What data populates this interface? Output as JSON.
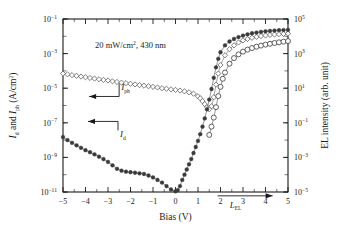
{
  "figure": {
    "annotation": "20 mW/cm2, 430 nm",
    "annotation_parts": {
      "pre": "20 mW/cm",
      "sup": "2",
      "post": ", 430 nm"
    },
    "background_color": "#ffffff",
    "foreground_color": "#1a1a1a"
  },
  "chart_data": {
    "type": "scatter",
    "title": "",
    "xlabel": "Bias (V)",
    "ylabel": "Id and Iph (A/cm2)",
    "y2label": "EL intensity (arb. unit)",
    "xlim": [
      -5,
      5
    ],
    "ylim": [
      1e-11,
      0.1
    ],
    "y2lim": [
      1e-05,
      100000.0
    ],
    "xscale": "linear",
    "yscale": "log",
    "y2scale": "log",
    "grid": false,
    "legend": "none",
    "xticks": [
      -5,
      -4,
      -3,
      -2,
      -1,
      0,
      1,
      2,
      3,
      4,
      5
    ],
    "xtick_labels": [
      "-5",
      "-4",
      "-3",
      "-2",
      "-1",
      "0",
      "1",
      "2",
      "3",
      "4",
      "5"
    ],
    "yticks": [
      1e-11,
      1e-09,
      1e-07,
      1e-05,
      0.001,
      0.1
    ],
    "ytick_labels": [
      "10-11",
      "10-9",
      "10-7",
      "10-5",
      "10-3",
      "10-1"
    ],
    "ytick_exponents": [
      -11,
      -9,
      -7,
      -5,
      -3,
      -1
    ],
    "y2ticks": [
      1e-05,
      0.001,
      0.1,
      10.0,
      1000.0,
      100000.0
    ],
    "y2tick_labels": [
      "10-5",
      "10-3",
      "10-1",
      "101",
      "103",
      "105"
    ],
    "y2tick_exponents": [
      -5,
      -3,
      -1,
      1,
      3,
      5
    ],
    "annotations": [
      {
        "text": "20 mW/cm2, 430 nm",
        "x": -2.0,
        "y": 0.002
      },
      {
        "text": "Iph",
        "x": -2.55,
        "y": 1.1e-05,
        "arrow_to_axis": "left"
      },
      {
        "text": "Id",
        "x": -2.6,
        "y": 1.2e-07,
        "arrow_to_axis": "left"
      },
      {
        "text": "LEL",
        "x": 2.85,
        "y": 6e-06,
        "arrow_to_axis": "right"
      }
    ],
    "series": [
      {
        "name": "Iph",
        "label": "Iph",
        "marker": "open-diamond",
        "color": "#555555",
        "axis": "left",
        "x": [
          -5.0,
          -4.8,
          -4.6,
          -4.4,
          -4.2,
          -4.0,
          -3.8,
          -3.6,
          -3.4,
          -3.2,
          -3.0,
          -2.8,
          -2.6,
          -2.4,
          -2.2,
          -2.0,
          -1.8,
          -1.6,
          -1.4,
          -1.2,
          -1.0,
          -0.8,
          -0.6,
          -0.4,
          -0.2,
          0.0,
          0.2,
          0.4,
          0.6,
          0.8,
          1.0,
          1.1,
          1.2,
          1.3,
          1.4,
          1.5,
          1.6,
          1.7,
          1.8,
          1.9,
          2.0,
          2.2,
          2.4,
          2.6,
          2.8,
          3.0,
          3.2,
          3.4,
          3.6,
          3.8,
          4.0,
          4.2,
          4.4,
          4.6,
          4.8,
          5.0
        ],
        "y": [
          7e-05,
          6.3e-05,
          5.7e-05,
          5.2e-05,
          4.7e-05,
          4.3e-05,
          3.9e-05,
          3.6e-05,
          3.3e-05,
          3e-05,
          2.8e-05,
          2.5e-05,
          2.3e-05,
          2.1e-05,
          1.95e-05,
          1.8e-05,
          1.65e-05,
          1.5e-05,
          1.4e-05,
          1.3e-05,
          1.2e-05,
          1.1e-05,
          1e-05,
          9.3e-06,
          8.6e-06,
          8e-06,
          7.3e-06,
          6.6e-06,
          5.8e-06,
          4.8e-06,
          3.4e-06,
          2.6e-06,
          1.8e-06,
          1.2e-06,
          8e-07,
          6e-07,
          9e-07,
          3e-06,
          1.6e-05,
          7e-05,
          0.00022,
          0.0008,
          0.0018,
          0.003,
          0.0044,
          0.0058,
          0.007,
          0.0082,
          0.0093,
          0.0103,
          0.0112,
          0.012,
          0.0127,
          0.0133,
          0.0138,
          0.0142
        ]
      },
      {
        "name": "Id",
        "label": "Id",
        "marker": "filled-circle",
        "color": "#3a3a3a",
        "axis": "left",
        "x": [
          -5.0,
          -4.8,
          -4.6,
          -4.4,
          -4.2,
          -4.0,
          -3.8,
          -3.6,
          -3.4,
          -3.2,
          -3.0,
          -2.8,
          -2.6,
          -2.4,
          -2.2,
          -2.0,
          -1.8,
          -1.6,
          -1.4,
          -1.2,
          -1.0,
          -0.8,
          -0.6,
          -0.4,
          -0.2,
          0.0,
          0.1,
          0.2,
          0.3,
          0.4,
          0.5,
          0.6,
          0.7,
          0.8,
          0.9,
          1.0,
          1.1,
          1.2,
          1.3,
          1.4,
          1.5,
          1.6,
          1.7,
          1.8,
          1.9,
          2.0,
          2.2,
          2.4,
          2.6,
          2.8,
          3.0,
          3.2,
          3.4,
          3.6,
          3.8,
          4.0,
          4.2,
          4.4,
          4.6,
          4.8,
          5.0
        ],
        "y": [
          1.5e-08,
          1e-08,
          7e-09,
          5e-09,
          3.6e-09,
          2.6e-09,
          2e-09,
          1.5e-09,
          1.1e-09,
          8e-10,
          5.5e-10,
          3.5e-10,
          2.2e-10,
          1.7e-10,
          1.5e-10,
          1.4e-10,
          1.3e-10,
          1.2e-10,
          1.1e-10,
          9e-11,
          7e-11,
          5e-11,
          3.5e-11,
          2.2e-11,
          1.4e-11,
          1.1e-11,
          1.3e-11,
          2.2e-11,
          5e-11,
          1e-10,
          2e-10,
          4e-10,
          8e-10,
          1.8e-09,
          4e-09,
          9e-09,
          2.2e-08,
          6e-08,
          1.8e-07,
          6e-07,
          2.2e-06,
          9e-06,
          4e-05,
          0.00016,
          0.0005,
          0.0012,
          0.003,
          0.005,
          0.007,
          0.009,
          0.011,
          0.013,
          0.015,
          0.0165,
          0.018,
          0.0195,
          0.0205,
          0.0215,
          0.0225,
          0.023,
          0.0235
        ]
      },
      {
        "name": "LEL",
        "label": "LEL",
        "marker": "open-circle",
        "color": "#3a3a3a",
        "axis": "right",
        "x": [
          1.5,
          1.6,
          1.7,
          1.8,
          1.9,
          2.0,
          2.1,
          2.2,
          2.4,
          2.6,
          2.8,
          3.0,
          3.2,
          3.4,
          3.6,
          3.8,
          4.0,
          4.2,
          4.4,
          4.6,
          4.8,
          5.0
        ],
        "y": [
          0.02,
          0.06,
          0.2,
          0.8,
          3.5,
          12.0,
          35.0,
          80.0,
          260.0,
          550.0,
          900.0,
          1300.0,
          1700.0,
          2100.0,
          2500.0,
          2900.0,
          3300.0,
          3700.0,
          4100.0,
          4500.0,
          4900.0,
          5300.0
        ]
      }
    ]
  }
}
